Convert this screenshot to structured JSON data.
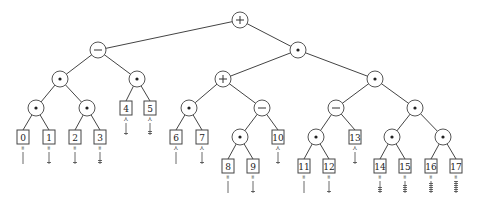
{
  "diagram": {
    "type": "expression-tree",
    "nodes": [
      {
        "id": "root",
        "kind": "op",
        "symbol": "+",
        "x": 240,
        "y": 20
      },
      {
        "id": "n1",
        "kind": "op",
        "symbol": "−",
        "x": 98,
        "y": 50,
        "parent": "root"
      },
      {
        "id": "n2",
        "kind": "op",
        "symbol": "•",
        "x": 298,
        "y": 50,
        "parent": "root"
      },
      {
        "id": "n3",
        "kind": "op",
        "symbol": "•",
        "x": 60,
        "y": 79,
        "parent": "n1"
      },
      {
        "id": "n4",
        "kind": "op",
        "symbol": "•",
        "x": 137,
        "y": 79,
        "parent": "n1"
      },
      {
        "id": "n5",
        "kind": "op",
        "symbol": "+",
        "x": 223,
        "y": 79,
        "parent": "n2"
      },
      {
        "id": "n6",
        "kind": "op",
        "symbol": "•",
        "x": 375,
        "y": 79,
        "parent": "n2"
      },
      {
        "id": "n7",
        "kind": "op",
        "symbol": "•",
        "x": 36,
        "y": 108,
        "parent": "n3"
      },
      {
        "id": "n8",
        "kind": "op",
        "symbol": "•",
        "x": 87,
        "y": 108,
        "parent": "n3"
      },
      {
        "id": "n9",
        "kind": "op",
        "symbol": "•",
        "x": 189,
        "y": 108,
        "parent": "n5"
      },
      {
        "id": "n10",
        "kind": "op",
        "symbol": "−",
        "x": 315,
        "y": 108,
        "parent": "n5"
      },
      {
        "id": "n11",
        "kind": "op",
        "symbol": "−",
        "x": 336,
        "y": 108,
        "parent": "n6"
      },
      {
        "id": "n12",
        "kind": "op",
        "symbol": "•",
        "x": 415,
        "y": 108,
        "parent": "n6"
      }
    ],
    "leaves": [
      {
        "label": "0",
        "x": 23,
        "y": 137,
        "parent": "n7",
        "mark": "∞",
        "ticks": 0
      },
      {
        "label": "1",
        "x": 49,
        "y": 137,
        "parent": "n7",
        "mark": "∞",
        "ticks": 1
      },
      {
        "label": "2",
        "x": 75,
        "y": 137,
        "parent": "n8",
        "mark": "∞",
        "ticks": 1
      },
      {
        "label": "3",
        "x": 100,
        "y": 137,
        "parent": "n8",
        "mark": "∞",
        "ticks": 2
      },
      {
        "label": "4",
        "x": 126,
        "y": 108,
        "parent": "n4",
        "mark": "≺",
        "ticks": 1
      },
      {
        "label": "5",
        "x": 150,
        "y": 108,
        "parent": "n4",
        "mark": "≺",
        "ticks": 2
      },
      {
        "label": "6",
        "x": 176,
        "y": 137,
        "parent": "n9",
        "mark": "≺",
        "ticks": 0
      },
      {
        "label": "7",
        "x": 202,
        "y": 137,
        "parent": "n9",
        "mark": "≺",
        "ticks": 1
      },
      {
        "label": "8",
        "x": 228,
        "y": 166,
        "parent": "n10b",
        "mark": "∞",
        "ticks": 0
      },
      {
        "label": "9",
        "x": 253,
        "y": 166,
        "parent": "n10b",
        "mark": "∞",
        "ticks": 1
      },
      {
        "label": "10",
        "x": 278,
        "y": 137,
        "parent": "n10",
        "mark": "≺",
        "ticks": 1
      },
      {
        "label": "11",
        "x": 304,
        "y": 166,
        "parent": "n11b",
        "mark": "∞",
        "ticks": 0
      },
      {
        "label": "12",
        "x": 329,
        "y": 166,
        "parent": "n11b",
        "mark": "∞",
        "ticks": 1
      },
      {
        "label": "13",
        "x": 355,
        "y": 137,
        "parent": "n11",
        "mark": "≺",
        "ticks": 1
      },
      {
        "label": "14",
        "x": 380,
        "y": 166,
        "parent": "n12a",
        "mark": "∞",
        "ticks": 3
      },
      {
        "label": "15",
        "x": 405,
        "y": 166,
        "parent": "n12a",
        "mark": "∞",
        "ticks": 4
      },
      {
        "label": "16",
        "x": 431,
        "y": 166,
        "parent": "n12b",
        "mark": "∞",
        "ticks": 5
      },
      {
        "label": "17",
        "x": 456,
        "y": 166,
        "parent": "n12b",
        "mark": "∞",
        "ticks": 6
      }
    ],
    "extra_ops": [
      {
        "id": "n10b",
        "symbol": "•",
        "x": 240,
        "y": 137,
        "parent": "n10"
      },
      {
        "id": "n11b",
        "symbol": "•",
        "x": 316,
        "y": 137,
        "parent": "n11"
      },
      {
        "id": "n12a",
        "symbol": "•",
        "x": 392,
        "y": 137,
        "parent": "n12"
      },
      {
        "id": "n12b",
        "symbol": "•",
        "x": 443,
        "y": 137,
        "parent": "n12"
      }
    ]
  }
}
